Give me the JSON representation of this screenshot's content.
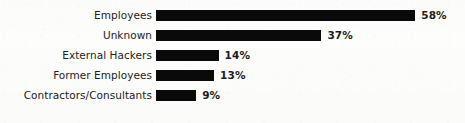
{
  "chart_data": {
    "type": "bar",
    "orientation": "horizontal",
    "title": "",
    "subtitle": "",
    "xlabel": "",
    "ylabel": "",
    "xlim": [
      0,
      58
    ],
    "grid": false,
    "legend": false,
    "value_suffix": "%",
    "categories": [
      "Employees",
      "Unknown",
      "External Hackers",
      "Former Employees",
      "Contractors/Consultants"
    ],
    "values": [
      58,
      37,
      14,
      13,
      9
    ],
    "value_labels": [
      "58%",
      "37%",
      "14%",
      "13%",
      "9%"
    ],
    "bar_color": "#0a0a0a",
    "background_color": "#fdfdfc",
    "text_color": "#1c1c1c"
  },
  "layout": {
    "bar_origin_x_px": 156,
    "label_right_edge_px": 152,
    "row_pitch_px": 20,
    "first_row_top_px": 8,
    "bar_height_px": 11,
    "px_per_percent": 4.47,
    "value_gap_px": 6
  }
}
